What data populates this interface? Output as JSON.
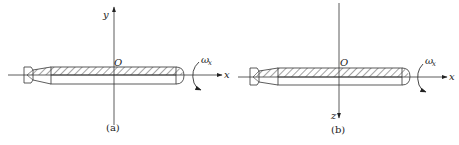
{
  "figure": {
    "panels": [
      {
        "id": "a",
        "caption": "(a)",
        "horizontal_axis_label": "x",
        "vertical_axis_label": "y",
        "vertical_axis_direction": "up",
        "origin_label": "O",
        "rotation_label_main": "ω",
        "rotation_label_sub": "x"
      },
      {
        "id": "b",
        "caption": "(b)",
        "horizontal_axis_label": "x",
        "vertical_axis_label": "z",
        "vertical_axis_direction": "down",
        "origin_label": "O",
        "rotation_label_main": "ω",
        "rotation_label_sub": "x"
      }
    ],
    "colors": {
      "line": "#333333",
      "hatch": "#555555",
      "background": "#ffffff"
    }
  }
}
